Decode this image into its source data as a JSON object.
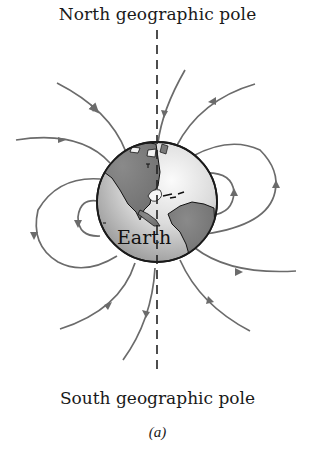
{
  "figure": {
    "title_top": "North geographic pole",
    "title_bottom": "South geographic pole",
    "globe_label": "Earth",
    "caption": "(a)"
  },
  "colors": {
    "field_line": "#6b6b6b",
    "axis": "#222222",
    "land": "#7a7a7a",
    "ocean_light": "#f2f2f2",
    "ocean_dark": "#9a9a9a",
    "outline": "#1a1a1a"
  },
  "diagram": {
    "type": "magnetic field lines around Earth",
    "axis": "dashed vertical line through geographic poles",
    "field_line_count": 10,
    "arrow_direction": "lines leave southern hemisphere and enter northern hemisphere"
  }
}
